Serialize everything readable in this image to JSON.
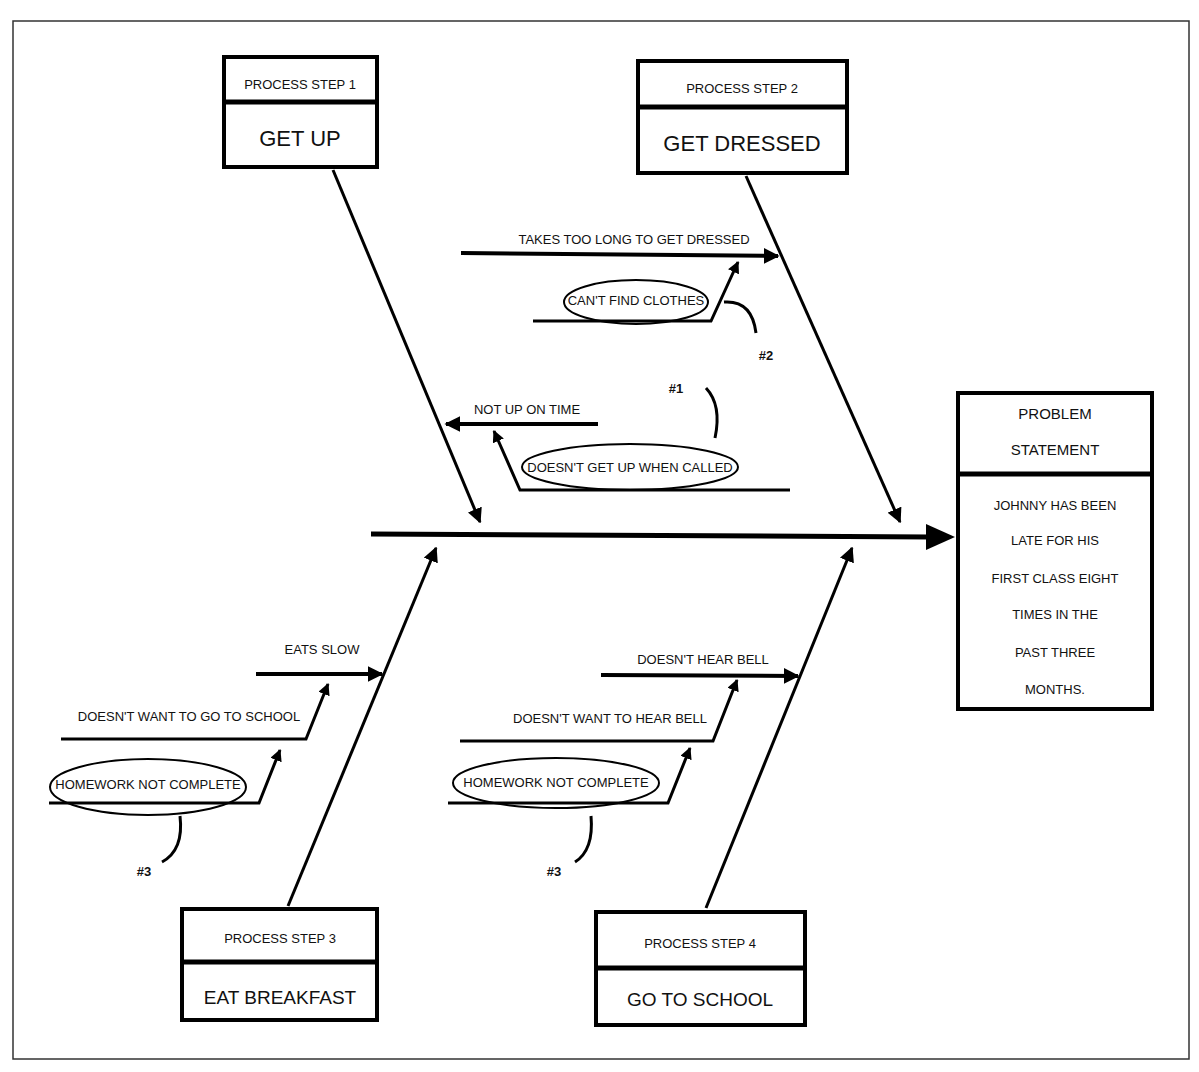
{
  "diagram": {
    "type": "fishbone",
    "problem": {
      "header_lines": [
        "PROBLEM",
        "STATEMENT"
      ],
      "body_lines": [
        "JOHNNY HAS BEEN",
        "LATE FOR HIS",
        "FIRST CLASS EIGHT",
        "TIMES IN THE",
        "PAST THREE",
        "MONTHS."
      ]
    },
    "steps": [
      {
        "header": "PROCESS STEP 1",
        "title": "GET UP",
        "causes": [
          {
            "label": "NOT UP ON TIME"
          },
          {
            "label": "DOESN'T GET UP WHEN CALLED",
            "circled": true,
            "note": "#1"
          }
        ]
      },
      {
        "header": "PROCESS STEP 2",
        "title": "GET DRESSED",
        "causes": [
          {
            "label": "TAKES TOO LONG TO GET DRESSED"
          },
          {
            "label": "CAN'T FIND CLOTHES",
            "circled": true,
            "note": "#2"
          }
        ]
      },
      {
        "header": "PROCESS STEP 3",
        "title": "EAT BREAKFAST",
        "causes": [
          {
            "label": "EATS SLOW"
          },
          {
            "label": "DOESN'T WANT TO GO TO SCHOOL"
          },
          {
            "label": "HOMEWORK NOT COMPLETE",
            "circled": true,
            "note": "#3"
          }
        ]
      },
      {
        "header": "PROCESS STEP 4",
        "title": "GO TO SCHOOL",
        "causes": [
          {
            "label": "DOESN'T HEAR BELL"
          },
          {
            "label": "DOESN'T WANT TO HEAR BELL"
          },
          {
            "label": "HOMEWORK NOT COMPLETE",
            "circled": true,
            "note": "#3"
          }
        ]
      }
    ]
  }
}
